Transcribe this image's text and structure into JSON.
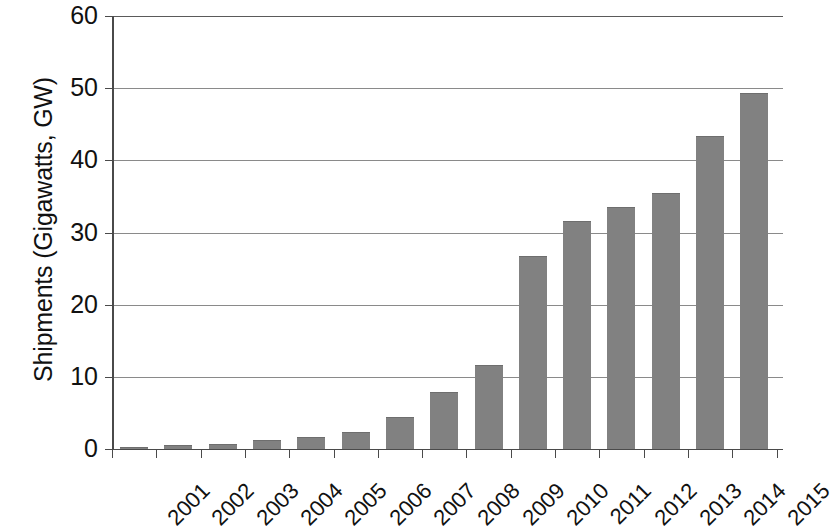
{
  "chart_data": {
    "type": "bar",
    "title": "",
    "xlabel": "",
    "ylabel": "Shipments (Gigawatts, GW)",
    "categories": [
      "2001",
      "2002",
      "2003",
      "2004",
      "2005",
      "2006",
      "2007",
      "2008",
      "2009",
      "2010",
      "2011",
      "2012",
      "2013",
      "2014",
      "2015"
    ],
    "values": [
      0.3,
      0.5,
      0.7,
      1.2,
      1.7,
      2.3,
      4.5,
      7.9,
      11.6,
      26.7,
      31.6,
      33.6,
      35.5,
      43.4,
      49.4
    ],
    "ylim": [
      0,
      60
    ],
    "y_ticks": [
      0,
      10,
      20,
      30,
      40,
      50,
      60
    ],
    "y_tick_labels": [
      "0",
      "10",
      "20",
      "30",
      "40",
      "50",
      "60"
    ],
    "grid": true,
    "legend": "none",
    "bar_color": "#818181",
    "axis_color": "#4a4a4a",
    "gridline_color": "#8a8a8a",
    "note": "right side of plot is cropped at image edge; 2015 bar is partially visible"
  }
}
